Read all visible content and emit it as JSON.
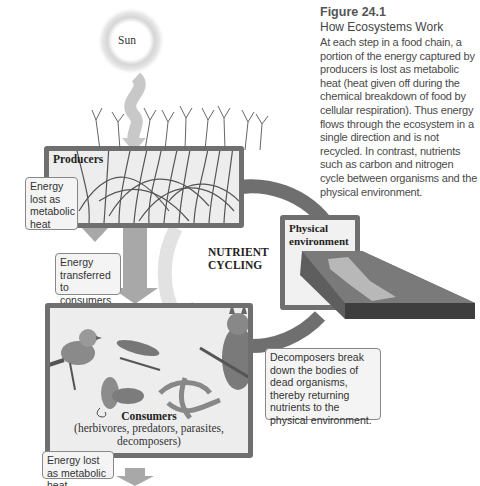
{
  "figure": {
    "number": "Figure 24.1",
    "title": "How Ecosystems Work",
    "caption": "At each step in a food chain, a portion of the energy captured by producers is lost as metabolic heat (heat given off during the chemical breakdown of food by cellular respiration). Thus energy flows through the ecosystem in a single direction and is not recycled. In contrast, nutrients such as carbon and nitrogen cycle between organisms and the physical environment."
  },
  "diagram": {
    "sun_label": "Sun",
    "producers_label": "Producers",
    "consumers_label": "Consumers",
    "consumers_sublabel": "(herbivores, predators, parasites, decomposers)",
    "physical_environment_label": "Physical environment",
    "nutrient_cycling_label_line1": "NUTRIENT",
    "nutrient_cycling_label_line2": "CYCLING",
    "callouts": {
      "producer_heat": "Energy lost as metabolic heat",
      "energy_transferred": "Energy transferred to consumers",
      "decomposers": "Decomposers break down the bodies of dead organisms, thereby returning nutrients to the physical environment.",
      "consumer_heat": "Energy lost as metabolic heat"
    },
    "colors": {
      "box_border": "#6f6f6f",
      "box_fill": "#ededed",
      "arrow_gray": "#a8a8a8",
      "cycle_arrow": "#707070"
    }
  }
}
